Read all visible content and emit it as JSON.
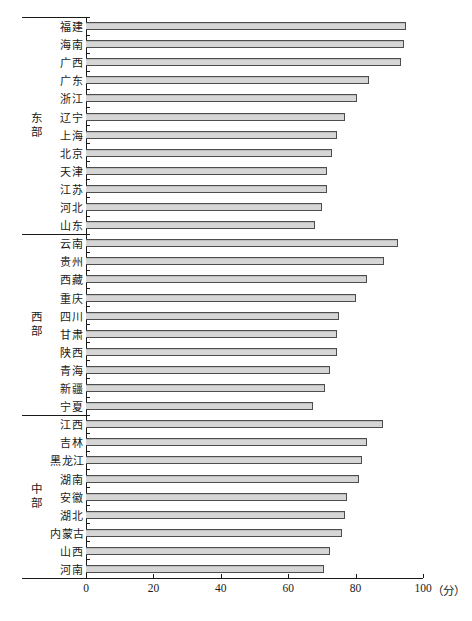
{
  "chart_data": {
    "type": "bar",
    "orientation": "horizontal",
    "title": "",
    "xlabel": "",
    "ylabel": "",
    "x_unit": "（分）",
    "xlim": [
      0,
      100
    ],
    "x_ticks": [
      "0",
      "20",
      "40",
      "60",
      "80",
      "100"
    ],
    "grid": false,
    "legend": "none",
    "bar_fill": "#d6d6d6",
    "bar_border": "#4d4d4d",
    "groups": [
      {
        "region": "东部",
        "items": [
          {
            "label": "福建",
            "value": 95
          },
          {
            "label": "海南",
            "value": 94.5
          },
          {
            "label": "广西",
            "value": 93.5
          },
          {
            "label": "广东",
            "value": 84
          },
          {
            "label": "浙江",
            "value": 80.5
          },
          {
            "label": "辽宁",
            "value": 77
          },
          {
            "label": "上海",
            "value": 74.5
          },
          {
            "label": "北京",
            "value": 73
          },
          {
            "label": "天津",
            "value": 71.5
          },
          {
            "label": "江苏",
            "value": 71.5
          },
          {
            "label": "河北",
            "value": 70
          },
          {
            "label": "山东",
            "value": 68
          }
        ]
      },
      {
        "region": "西部",
        "items": [
          {
            "label": "云南",
            "value": 92.5
          },
          {
            "label": "贵州",
            "value": 88.5
          },
          {
            "label": "西藏",
            "value": 83.5
          },
          {
            "label": "重庆",
            "value": 80
          },
          {
            "label": "四川",
            "value": 75
          },
          {
            "label": "甘肃",
            "value": 74.5
          },
          {
            "label": "陕西",
            "value": 74.5
          },
          {
            "label": "青海",
            "value": 72.5
          },
          {
            "label": "新疆",
            "value": 71
          },
          {
            "label": "宁夏",
            "value": 67.5
          }
        ]
      },
      {
        "region": "中部",
        "items": [
          {
            "label": "江西",
            "value": 88
          },
          {
            "label": "吉林",
            "value": 83.5
          },
          {
            "label": "黑龙江",
            "value": 82
          },
          {
            "label": "湖南",
            "value": 81
          },
          {
            "label": "安徽",
            "value": 77.5
          },
          {
            "label": "湖北",
            "value": 77
          },
          {
            "label": "内蒙古",
            "value": 76
          },
          {
            "label": "山西",
            "value": 72.5
          },
          {
            "label": "河南",
            "value": 70.5
          }
        ]
      }
    ]
  },
  "colors": {
    "background": "#ffffff",
    "axis": "#1a1a1a",
    "text": "#1a1a1a",
    "bar_fill": "#d6d6d6",
    "bar_border": "#4d4d4d"
  }
}
